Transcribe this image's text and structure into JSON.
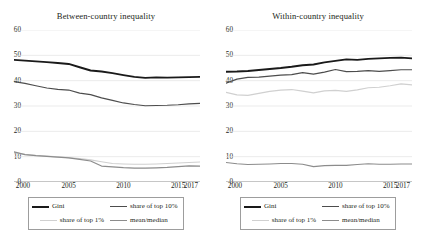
{
  "figure": {
    "panels": [
      {
        "id": "between-country",
        "title": "Between-country inequality"
      },
      {
        "id": "within-country",
        "title": "Within-country inequality"
      }
    ],
    "legend": {
      "items": [
        {
          "label": "Gini",
          "color": "#1a1a1a",
          "width": 2.0
        },
        {
          "label": "share of top 10%",
          "color": "#4d4d4d",
          "width": 1.3
        },
        {
          "label": "share of top 1%",
          "color": "#d0d0d0",
          "width": 1.3
        },
        {
          "label": "mean/median",
          "color": "#8c8c8c",
          "width": 1.3
        }
      ]
    },
    "colors": {
      "gridline": "#e3e3e3",
      "axis": "#808080",
      "text": "#231f20",
      "legend_border": "#9d9d9d"
    }
  },
  "chart_data": [
    {
      "type": "line",
      "title": "Between-country inequality",
      "xlabel": "",
      "ylabel": "",
      "xlim": [
        2000,
        2017
      ],
      "ylim": [
        0,
        60
      ],
      "yticks": [
        0,
        10,
        20,
        30,
        40,
        50,
        60
      ],
      "xticks": [
        2000,
        2005,
        2010,
        2015,
        2017
      ],
      "grid": true,
      "legend_position": "bottom",
      "x": [
        2000,
        2001,
        2002,
        2003,
        2004,
        2005,
        2006,
        2007,
        2008,
        2009,
        2010,
        2011,
        2012,
        2013,
        2014,
        2015,
        2016,
        2017
      ],
      "series": [
        {
          "name": "Gini",
          "color": "#1a1a1a",
          "values": [
            48.2,
            47.9,
            47.6,
            47.3,
            47.0,
            46.6,
            45.3,
            44.0,
            43.6,
            43.0,
            42.2,
            41.5,
            41.1,
            41.3,
            41.2,
            41.3,
            41.4,
            41.5
          ]
        },
        {
          "name": "share of top 10%",
          "color": "#4d4d4d",
          "values": [
            39.6,
            38.9,
            38.0,
            37.1,
            36.6,
            36.3,
            35.1,
            34.5,
            33.2,
            32.2,
            31.2,
            30.6,
            30.1,
            30.2,
            30.3,
            30.5,
            30.8,
            31.0
          ]
        },
        {
          "name": "share of top 1%",
          "color": "#d0d0d0",
          "values": [
            11.6,
            10.9,
            10.5,
            10.2,
            9.9,
            9.6,
            9.2,
            8.7,
            8.0,
            7.3,
            7.1,
            7.0,
            7.0,
            7.1,
            7.3,
            7.5,
            7.7,
            7.9
          ]
        },
        {
          "name": "mean/median",
          "color": "#8c8c8c",
          "values": [
            11.9,
            10.8,
            10.4,
            10.1,
            9.8,
            9.5,
            8.9,
            8.3,
            6.3,
            6.0,
            5.7,
            5.5,
            5.5,
            5.6,
            5.8,
            6.1,
            6.4,
            6.3
          ]
        }
      ]
    },
    {
      "type": "line",
      "title": "Within-country inequality",
      "xlabel": "",
      "ylabel": "",
      "xlim": [
        2000,
        2017
      ],
      "ylim": [
        0,
        60
      ],
      "yticks": [
        0,
        10,
        20,
        30,
        40,
        50,
        60
      ],
      "xticks": [
        2000,
        2005,
        2010,
        2015,
        2017
      ],
      "grid": true,
      "legend_position": "bottom",
      "x": [
        2000,
        2001,
        2002,
        2003,
        2004,
        2005,
        2006,
        2007,
        2008,
        2009,
        2010,
        2011,
        2012,
        2013,
        2014,
        2015,
        2016,
        2017
      ],
      "series": [
        {
          "name": "Gini",
          "color": "#1a1a1a",
          "values": [
            43.5,
            43.6,
            43.8,
            44.2,
            44.6,
            45.0,
            45.5,
            46.1,
            46.4,
            47.2,
            47.8,
            48.4,
            48.2,
            48.6,
            48.8,
            49.0,
            49.1,
            48.8
          ]
        },
        {
          "name": "share of top 10%",
          "color": "#4d4d4d",
          "values": [
            39.0,
            40.6,
            41.3,
            41.4,
            41.8,
            42.2,
            42.4,
            43.2,
            42.6,
            43.4,
            44.4,
            43.6,
            43.7,
            44.0,
            43.7,
            44.0,
            44.3,
            44.3
          ]
        },
        {
          "name": "share of top 1%",
          "color": "#d0d0d0",
          "values": [
            35.4,
            34.4,
            34.2,
            35.0,
            35.8,
            36.3,
            36.5,
            35.9,
            35.2,
            36.0,
            36.2,
            35.8,
            36.4,
            37.2,
            37.4,
            38.0,
            38.7,
            38.3
          ]
        },
        {
          "name": "mean/median",
          "color": "#8c8c8c",
          "values": [
            7.7,
            7.2,
            6.9,
            7.0,
            7.1,
            7.3,
            7.3,
            7.0,
            6.1,
            6.5,
            6.6,
            6.6,
            6.9,
            7.2,
            7.0,
            7.0,
            7.1,
            7.1
          ]
        }
      ]
    }
  ]
}
